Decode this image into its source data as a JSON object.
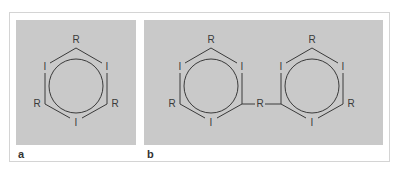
{
  "figure": {
    "panels": [
      {
        "label": "a",
        "molecule": "1,3,5-triiodo-2,4,6-trisubstituted benzene",
        "substituents": {
          "top": "R",
          "upper_left": "I",
          "upper_right": "I",
          "lower_left": "R",
          "lower_right": "R",
          "bottom": "I"
        }
      },
      {
        "label": "b",
        "molecule": "dimer: two triiodobenzene rings linked by R",
        "left_ring": {
          "top": "R",
          "upper_left": "I",
          "upper_right": "I",
          "lower_left": "R",
          "bottom": "I"
        },
        "bridge": "R",
        "right_ring": {
          "top": "R",
          "upper_left": "I",
          "upper_right": "I",
          "lower_right": "R",
          "bottom": "I"
        }
      }
    ]
  },
  "colors": {
    "panel_bg": "#c9c9c9",
    "line": "#3a3a3a",
    "frame": "#d4d4d4"
  }
}
